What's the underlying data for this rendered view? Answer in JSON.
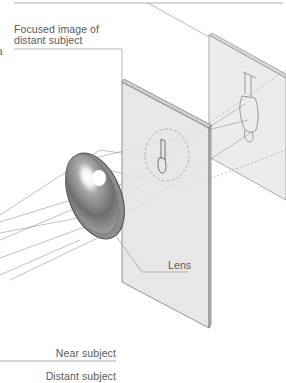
{
  "diagram": {
    "labels": {
      "focused_image_line1": "Focused image of",
      "focused_image_line2": "distant subject",
      "lens": "Lens",
      "near_subject": "Near subject",
      "distant_subject": "Distant subject",
      "left_fragment": "a"
    },
    "elements": [
      {
        "id": "lens",
        "type": "convex-lens"
      },
      {
        "id": "near-screen",
        "type": "image-plane",
        "content": "focused-image-distant-subject"
      },
      {
        "id": "far-screen",
        "type": "image-plane",
        "content": "focused-image-near-subject"
      }
    ],
    "colors": {
      "line": "#8a8a8a",
      "panel_fill": "#e6e6e6",
      "panel_edge": "#6a6a6a",
      "lens_dark": "#4a4a4a",
      "lens_mid": "#9a9a9a",
      "text": "#5a5a5a"
    }
  }
}
